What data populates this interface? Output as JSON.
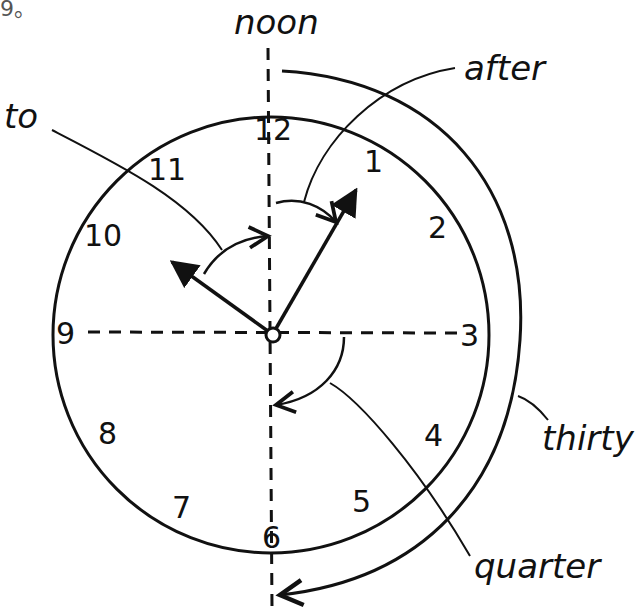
{
  "corner_text": "9。",
  "labels": {
    "noon": "noon",
    "to": "to",
    "after": "after",
    "thirty": "thirty",
    "quarter": "quarter"
  },
  "clock": {
    "numbers": [
      "12",
      "1",
      "2",
      "3",
      "4",
      "5",
      "6",
      "7",
      "8",
      "9",
      "10",
      "11"
    ],
    "hour_hand_points_to": "10",
    "minute_hand_points_to": "1"
  },
  "colors": {
    "ink": "#111111",
    "background": "#ffffff"
  }
}
